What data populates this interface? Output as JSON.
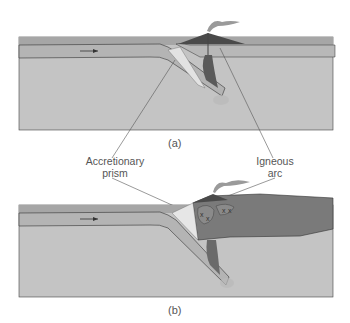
{
  "diagram": {
    "type": "subduction-zone-cross-sections",
    "panels": [
      {
        "id": "a",
        "caption": "(a)"
      },
      {
        "id": "b",
        "caption": "(b)"
      }
    ],
    "labels": {
      "accretionary_prism": [
        "Accretionary",
        "prism"
      ],
      "igneous_arc": [
        "Igneous",
        "arc"
      ]
    },
    "colors": {
      "ocean": "#a9a9a9",
      "plate": "#bdbdbd",
      "mantle": "#c4c4c4",
      "continent": "#7a7a7a",
      "volcano": "#4a4a4a",
      "prism": "#e6e6e6",
      "outline": "#333333"
    }
  }
}
